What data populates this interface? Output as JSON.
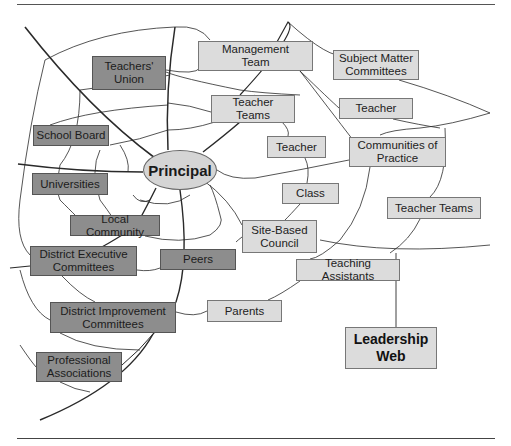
{
  "diagram": {
    "type": "web",
    "center": {
      "label": "Principal"
    },
    "title_box": {
      "label": "Leadership\nWeb"
    },
    "nodes": [
      {
        "id": "teachers-union",
        "label": "Teachers'\nUnion",
        "shade": "dark",
        "x": 92,
        "y": 56,
        "w": 74,
        "h": 34
      },
      {
        "id": "management-team",
        "label": "Management\nTeam",
        "shade": "light",
        "x": 198,
        "y": 41,
        "w": 115,
        "h": 30
      },
      {
        "id": "subject-matter-committees",
        "label": "Subject Matter\nCommittees",
        "shade": "light",
        "x": 333,
        "y": 50,
        "w": 86,
        "h": 30
      },
      {
        "id": "teacher-teams-top",
        "label": "Teacher\nTeams",
        "shade": "light",
        "x": 211,
        "y": 95,
        "w": 84,
        "h": 28
      },
      {
        "id": "teacher-right",
        "label": "Teacher",
        "shade": "light",
        "x": 339,
        "y": 98,
        "w": 74,
        "h": 21
      },
      {
        "id": "school-board",
        "label": "School Board",
        "shade": "dark",
        "x": 33,
        "y": 125,
        "w": 76,
        "h": 21
      },
      {
        "id": "teacher-mid",
        "label": "Teacher",
        "shade": "light",
        "x": 267,
        "y": 136,
        "w": 59,
        "h": 22
      },
      {
        "id": "communities-of-practice",
        "label": "Communities of\nPractice",
        "shade": "light",
        "x": 349,
        "y": 137,
        "w": 97,
        "h": 30
      },
      {
        "id": "universities",
        "label": "Universities",
        "shade": "dark",
        "x": 32,
        "y": 173,
        "w": 76,
        "h": 22
      },
      {
        "id": "class",
        "label": "Class",
        "shade": "light",
        "x": 282,
        "y": 183,
        "w": 57,
        "h": 21
      },
      {
        "id": "teacher-teams-right",
        "label": "Teacher Teams",
        "shade": "light",
        "x": 387,
        "y": 197,
        "w": 94,
        "h": 22
      },
      {
        "id": "local-community",
        "label": "Local Community",
        "shade": "dark",
        "x": 70,
        "y": 215,
        "w": 90,
        "h": 21
      },
      {
        "id": "site-based-council",
        "label": "Site-Based\nCouncil",
        "shade": "light",
        "x": 242,
        "y": 220,
        "w": 75,
        "h": 33
      },
      {
        "id": "district-executive-committees",
        "label": "District Executive\nCommittees",
        "shade": "dark",
        "x": 30,
        "y": 246,
        "w": 107,
        "h": 30
      },
      {
        "id": "peers",
        "label": "Peers",
        "shade": "dark",
        "x": 160,
        "y": 249,
        "w": 76,
        "h": 21
      },
      {
        "id": "teaching-assistants",
        "label": "Teaching Assistants",
        "shade": "light",
        "x": 296,
        "y": 259,
        "w": 104,
        "h": 22
      },
      {
        "id": "parents",
        "label": "Parents",
        "shade": "light",
        "x": 207,
        "y": 300,
        "w": 75,
        "h": 22
      },
      {
        "id": "district-improvement-committees",
        "label": "District Improvement\nCommittees",
        "shade": "dark",
        "x": 50,
        "y": 302,
        "w": 126,
        "h": 31
      },
      {
        "id": "professional-associations",
        "label": "Professional\nAssociations",
        "shade": "dark",
        "x": 36,
        "y": 352,
        "w": 86,
        "h": 30
      }
    ],
    "colors": {
      "dark_box": "#8d8d8d",
      "light_box": "#dcdcdc",
      "line": "#333333",
      "background": "#ffffff"
    }
  }
}
